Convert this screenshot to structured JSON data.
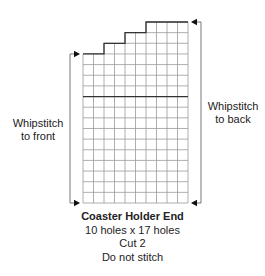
{
  "diagram": {
    "grid": {
      "columns": 10,
      "rows": 17,
      "stepped_top": [
        {
          "cols": [
            0,
            2
          ],
          "top_row": 3
        },
        {
          "cols": [
            2,
            4
          ],
          "top_row": 2
        },
        {
          "cols": [
            4,
            6
          ],
          "top_row": 1
        },
        {
          "cols": [
            6,
            10
          ],
          "top_row": 0
        }
      ],
      "divider_row": 7
    },
    "labels": {
      "left": [
        "Whipstitch",
        "to front"
      ],
      "right": [
        "Whipstitch",
        "to back"
      ]
    },
    "caption": {
      "title": "Coaster Holder End",
      "size": "10 holes x 17 holes",
      "cut": "Cut 2",
      "note": "Do not stitch"
    },
    "colors": {
      "grid_line": "#9a9a9a",
      "outline": "#333333",
      "text": "#222222"
    }
  }
}
